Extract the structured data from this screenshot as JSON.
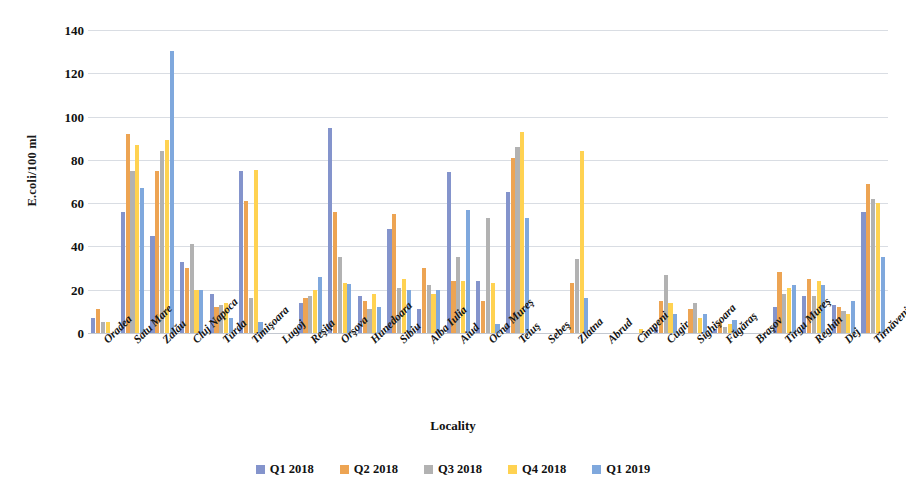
{
  "chart_data": {
    "type": "bar",
    "title": "",
    "xlabel": "Locality",
    "ylabel": "E.coli/100 ml",
    "ylim": [
      0,
      140
    ],
    "ytick_values": [
      0,
      20,
      40,
      60,
      80,
      100,
      120,
      140
    ],
    "ytick_labels": [
      "0",
      "20",
      "40",
      "60",
      "80",
      "100",
      "120",
      "140"
    ],
    "grid": true,
    "legend_position": "bottom",
    "categories": [
      "Oradea",
      "Satu Mare",
      "Zalău",
      "Cluj Napoca",
      "Turda",
      "Timişoara",
      "Lugoj",
      "Reşiţa",
      "Orşova",
      "Hunedoara",
      "Sibiu",
      "Alba Iulia",
      "Aiud",
      "Ocna Mureş",
      "Teiuş",
      "Sebeş",
      "Zlatna",
      "Abrud",
      "Cîmpeni",
      "Cugir",
      "Sighişoara",
      "Făgăraş",
      "Braşov",
      "Tîrgu Mureş",
      "Reghin",
      "Dej",
      "Tîrnăveni"
    ],
    "series": [
      {
        "name": "Q1 2018",
        "color": "#8494cc",
        "values": [
          7,
          56,
          45,
          33,
          18,
          75,
          0,
          14,
          94.5,
          17,
          48,
          11,
          74.5,
          24,
          65,
          0,
          0,
          0,
          0,
          3,
          0,
          2,
          0,
          12,
          17,
          13,
          56
        ]
      },
      {
        "name": "Q2 2018",
        "color": "#eda453",
        "values": [
          11,
          92,
          75,
          30,
          12,
          61,
          0,
          16,
          56,
          15,
          55,
          30,
          24,
          15,
          81,
          0,
          23,
          0,
          0,
          15,
          11,
          5,
          0,
          28,
          25,
          12,
          69
        ]
      },
      {
        "name": "Q3 2018",
        "color": "#b2b2b2",
        "values": [
          5,
          75,
          84,
          41,
          13,
          16,
          0,
          17,
          35,
          11,
          21,
          22,
          35,
          53,
          86,
          0,
          34,
          0,
          0,
          27,
          14,
          3,
          0,
          18,
          17,
          10,
          62
        ]
      },
      {
        "name": "Q4 2018",
        "color": "#ffd251",
        "values": [
          5,
          87,
          89,
          20,
          14,
          75.5,
          0,
          20,
          23,
          18,
          25,
          18,
          24,
          23,
          93,
          0,
          84,
          0,
          2,
          14,
          7,
          4,
          0,
          21,
          24,
          9,
          60
        ]
      },
      {
        "name": "Q1 2019",
        "color": "#7fa8dd",
        "values": [
          0,
          67,
          130.5,
          20,
          7,
          5,
          0,
          26,
          22.5,
          12,
          20,
          20,
          57,
          4,
          53,
          0,
          16,
          0,
          0,
          9,
          9,
          6,
          0,
          22,
          22,
          15,
          35
        ]
      }
    ]
  }
}
